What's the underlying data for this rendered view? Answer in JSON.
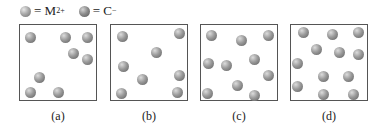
{
  "legend": {
    "items": [
      {
        "symbol": "sphere",
        "label_prefix": "= M",
        "superscript": "2+"
      },
      {
        "symbol": "sphere",
        "label_prefix": "= C",
        "superscript": "−"
      }
    ]
  },
  "panels": [
    {
      "label": "(a)",
      "left": 19,
      "spheres": [
        [
          10,
          12
        ],
        [
          45,
          12
        ],
        [
          67,
          12
        ],
        [
          53,
          28
        ],
        [
          67,
          34
        ],
        [
          19,
          52
        ],
        [
          10,
          67
        ],
        [
          38,
          67
        ]
      ]
    },
    {
      "label": "(b)",
      "left": 110,
      "spheres": [
        [
          11,
          11
        ],
        [
          68,
          8
        ],
        [
          45,
          27
        ],
        [
          12,
          41
        ],
        [
          31,
          54
        ],
        [
          68,
          50
        ],
        [
          10,
          68
        ],
        [
          66,
          67
        ]
      ]
    },
    {
      "label": "(c)",
      "left": 200,
      "spheres": [
        [
          10,
          10
        ],
        [
          40,
          15
        ],
        [
          67,
          10
        ],
        [
          7,
          38
        ],
        [
          25,
          40
        ],
        [
          53,
          34
        ],
        [
          67,
          50
        ],
        [
          36,
          60
        ],
        [
          6,
          68
        ],
        [
          53,
          70
        ]
      ]
    },
    {
      "label": "(d)",
      "left": 290,
      "spheres": [
        [
          12,
          7
        ],
        [
          41,
          9
        ],
        [
          67,
          7
        ],
        [
          25,
          24
        ],
        [
          48,
          27
        ],
        [
          67,
          29
        ],
        [
          6,
          38
        ],
        [
          32,
          51
        ],
        [
          57,
          51
        ],
        [
          6,
          61
        ],
        [
          32,
          69
        ],
        [
          62,
          69
        ]
      ]
    }
  ],
  "colors": {
    "border": "#555555",
    "sphere": "#8a8a8a",
    "background": "#ffffff"
  }
}
